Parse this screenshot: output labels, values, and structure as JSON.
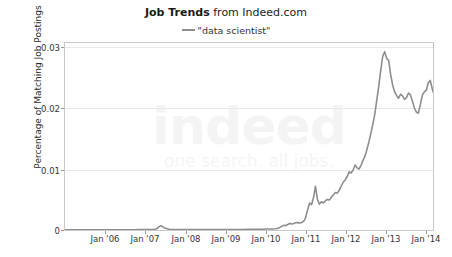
{
  "title": {
    "strong": "Job Trends",
    "rest": " from Indeed.com",
    "full": "Job Trends from Indeed.com"
  },
  "legend": {
    "position": "top-center",
    "swatch_icon": "line-dash-icon",
    "entries": [
      {
        "label": "\"data scientist\"",
        "color": "#8d8d8d"
      }
    ]
  },
  "watermark": {
    "word": "indeed",
    "tagline": "one search. all jobs."
  },
  "axes": {
    "ylabel": "Percentage of Matching Job Postings",
    "xlabel": "",
    "yticks": [
      "0",
      "0.01",
      "0.02",
      "0.03"
    ],
    "ytick_values": [
      0,
      0.01,
      0.02,
      0.03
    ],
    "xticks": [
      "Jan '06",
      "Jan '07",
      "Jan '08",
      "Jan '09",
      "Jan '10",
      "Jan '11",
      "Jan '12",
      "Jan '13",
      "Jan '14"
    ],
    "xtick_values": [
      2006.0,
      2007.0,
      2008.0,
      2009.0,
      2010.0,
      2011.0,
      2012.0,
      2013.0,
      2014.0
    ]
  },
  "colors": {
    "line": "#8d8d8d",
    "grid": "#e8e8e8",
    "frame": "#c8c8c8",
    "text": "#333333",
    "background": "#ffffff",
    "watermark": "#f4f4f4"
  },
  "chart_data": {
    "type": "line",
    "title": "Job Trends from Indeed.com",
    "subtitle": "\"data scientist\"",
    "xlabel": "",
    "ylabel": "Percentage of Matching Job Postings",
    "xlim": [
      2005.62,
      2014.92
    ],
    "ylim": [
      0,
      0.0325
    ],
    "grid": true,
    "legend_position": "top-center",
    "xticks": [
      2006,
      2007,
      2008,
      2009,
      2010,
      2011,
      2012,
      2013,
      2014
    ],
    "xticklabels": [
      "Jan '06",
      "Jan '07",
      "Jan '08",
      "Jan '09",
      "Jan '10",
      "Jan '11",
      "Jan '12",
      "Jan '13",
      "Jan '14"
    ],
    "yticks": [
      0,
      0.01,
      0.02,
      0.03
    ],
    "yticklabels": [
      "0",
      "0.01",
      "0.02",
      "0.03"
    ],
    "series": [
      {
        "name": "\"data scientist\"",
        "color": "#8d8d8d",
        "x": [
          2005.62,
          2005.75,
          2005.87,
          2006.0,
          2006.12,
          2006.25,
          2006.37,
          2006.5,
          2006.62,
          2006.75,
          2006.87,
          2007.0,
          2007.12,
          2007.25,
          2007.37,
          2007.5,
          2007.62,
          2007.75,
          2007.87,
          2007.95,
          2008.0,
          2008.05,
          2008.12,
          2008.25,
          2008.37,
          2008.5,
          2008.62,
          2008.75,
          2008.87,
          2009.0,
          2009.12,
          2009.25,
          2009.37,
          2009.5,
          2009.62,
          2009.75,
          2009.87,
          2010.0,
          2010.12,
          2010.25,
          2010.37,
          2010.5,
          2010.62,
          2010.75,
          2010.87,
          2010.95,
          2011.0,
          2011.05,
          2011.1,
          2011.15,
          2011.2,
          2011.25,
          2011.3,
          2011.35,
          2011.4,
          2011.45,
          2011.5,
          2011.55,
          2011.6,
          2011.65,
          2011.7,
          2011.75,
          2011.8,
          2011.85,
          2011.9,
          2011.95,
          2012.0,
          2012.05,
          2012.1,
          2012.15,
          2012.2,
          2012.25,
          2012.3,
          2012.35,
          2012.4,
          2012.45,
          2012.5,
          2012.55,
          2012.6,
          2012.65,
          2012.7,
          2012.75,
          2012.8,
          2012.85,
          2012.9,
          2012.95,
          2013.0,
          2013.05,
          2013.1,
          2013.15,
          2013.2,
          2013.25,
          2013.3,
          2013.35,
          2013.4,
          2013.45,
          2013.5,
          2013.55,
          2013.6,
          2013.65,
          2013.7,
          2013.75,
          2013.8,
          2013.85,
          2013.9,
          2013.95,
          2014.0,
          2014.05,
          2014.1,
          2014.15,
          2014.2,
          2014.25,
          2014.3,
          2014.35,
          2014.4,
          2014.45,
          2014.5,
          2014.55,
          2014.6,
          2014.65,
          2014.7,
          2014.75,
          2014.8,
          2014.85,
          2014.92
        ],
        "y": [
          2e-05,
          2e-05,
          3e-05,
          3e-05,
          3e-05,
          3e-05,
          3e-05,
          4e-05,
          4e-05,
          4e-05,
          4e-05,
          4e-05,
          5e-05,
          5e-05,
          5e-05,
          6e-05,
          6e-05,
          7e-05,
          0.0001,
          0.00028,
          0.0006,
          0.00075,
          0.0004,
          0.00012,
          7e-05,
          6e-05,
          6e-05,
          6e-05,
          6e-05,
          6e-05,
          6e-05,
          6e-05,
          7e-05,
          7e-05,
          7e-05,
          8e-05,
          8e-05,
          9e-05,
          0.0001,
          0.00011,
          0.00012,
          0.00013,
          0.00014,
          0.00016,
          0.00018,
          0.00022,
          0.0003,
          0.00045,
          0.00065,
          0.0008,
          0.00078,
          0.00095,
          0.00115,
          0.00105,
          0.00112,
          0.00125,
          0.00128,
          0.00122,
          0.0013,
          0.0015,
          0.0021,
          0.0035,
          0.0047,
          0.0044,
          0.0056,
          0.0076,
          0.0053,
          0.0045,
          0.0049,
          0.0047,
          0.0051,
          0.0053,
          0.0052,
          0.0057,
          0.0061,
          0.0065,
          0.0064,
          0.0069,
          0.0076,
          0.0083,
          0.0087,
          0.0093,
          0.0101,
          0.0099,
          0.0104,
          0.0113,
          0.0108,
          0.0106,
          0.0112,
          0.0121,
          0.0128,
          0.014,
          0.0153,
          0.0168,
          0.0184,
          0.0202,
          0.0226,
          0.025,
          0.0278,
          0.0302,
          0.031,
          0.0298,
          0.0295,
          0.027,
          0.0252,
          0.024,
          0.0234,
          0.0229,
          0.0236,
          0.0233,
          0.0227,
          0.023,
          0.0238,
          0.0235,
          0.0224,
          0.0212,
          0.0205,
          0.0203,
          0.0218,
          0.0234,
          0.024,
          0.0243,
          0.0256,
          0.026,
          0.024
        ],
        "annotations": {
          "peak_value": 0.031,
          "peak_x_label": "mid 2013",
          "end_value": 0.024,
          "start_value": 2e-05,
          "small_bump_2008_value": 0.00075
        }
      }
    ]
  }
}
